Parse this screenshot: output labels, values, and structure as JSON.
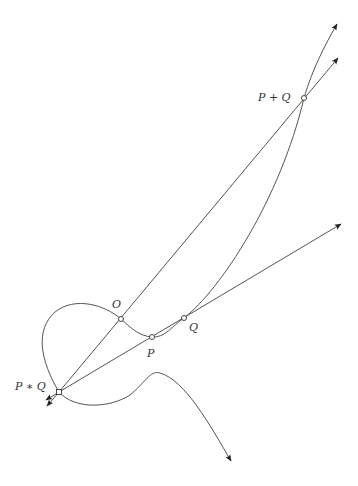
{
  "diagram": {
    "colors": {
      "stroke": "#555555",
      "text": "#333333",
      "background": "#ffffff"
    },
    "points": {
      "O": {
        "label": "O",
        "x": 121,
        "y": 319,
        "label_x": 112,
        "label_y": 308
      },
      "P": {
        "label": "P",
        "x": 152,
        "y": 337,
        "label_x": 147,
        "label_y": 357
      },
      "Q": {
        "label": "Q",
        "x": 184,
        "y": 318,
        "label_x": 189,
        "label_y": 331
      },
      "P_plus_Q": {
        "label": "P + Q",
        "x": 304,
        "y": 98,
        "label_x": 258,
        "label_y": 101
      },
      "P_star_Q": {
        "label": "P ∗ Q",
        "x": 59,
        "y": 392,
        "label_x": 15,
        "label_y": 390
      }
    },
    "lines": [
      {
        "name": "line-through-P-and-Q",
        "from": "P*Q",
        "to": "arrow-right"
      },
      {
        "name": "line-through-O-and-P+Q",
        "from": "P*Q",
        "to": "arrow-top"
      }
    ],
    "curve_description": "Cubic curve with a loop through P*Q and O, branch through P and Q rising to P+Q"
  }
}
